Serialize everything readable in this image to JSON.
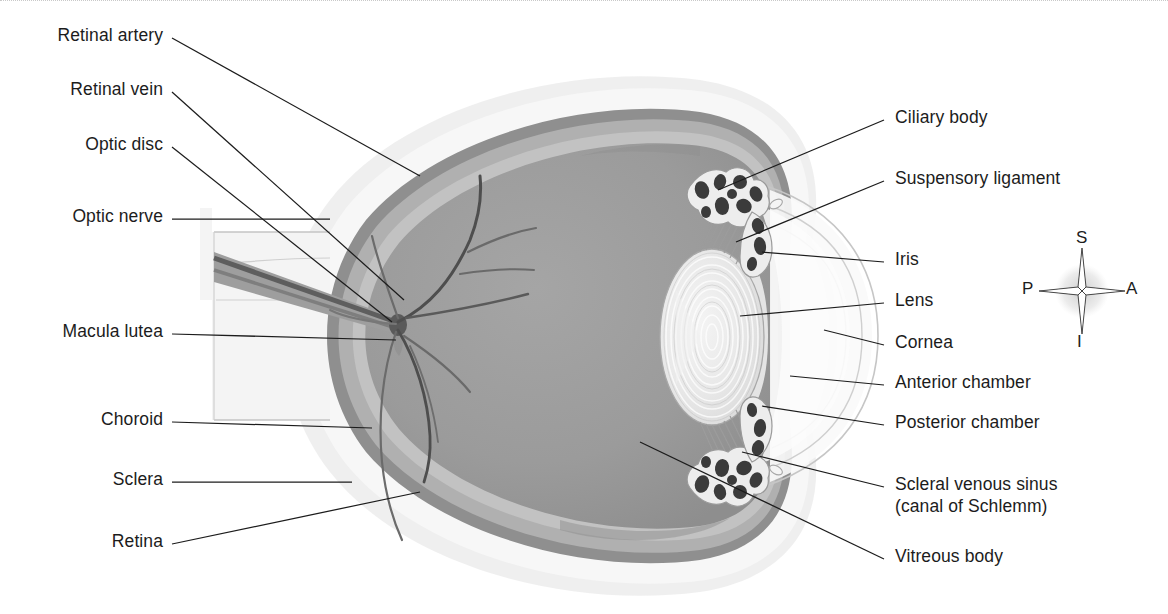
{
  "labels_left": [
    {
      "id": "retinal-artery",
      "text": "Retinal artery",
      "x": 163,
      "y": 34
    },
    {
      "id": "retinal-vein",
      "text": "Retinal vein",
      "x": 163,
      "y": 88
    },
    {
      "id": "optic-disc",
      "text": "Optic disc",
      "x": 163,
      "y": 143
    },
    {
      "id": "optic-nerve",
      "text": "Optic nerve",
      "x": 163,
      "y": 215
    },
    {
      "id": "macula-lutea",
      "text": "Macula lutea",
      "x": 163,
      "y": 330
    },
    {
      "id": "choroid",
      "text": "Choroid",
      "x": 163,
      "y": 418
    },
    {
      "id": "sclera",
      "text": "Sclera",
      "x": 163,
      "y": 478
    },
    {
      "id": "retina",
      "text": "Retina",
      "x": 163,
      "y": 540
    }
  ],
  "labels_right": [
    {
      "id": "ciliary-body",
      "text": "Ciliary body",
      "x": 895,
      "y": 116
    },
    {
      "id": "suspensory-ligament",
      "text": "Suspensory ligament",
      "x": 895,
      "y": 177
    },
    {
      "id": "iris",
      "text": "Iris",
      "x": 895,
      "y": 258
    },
    {
      "id": "lens",
      "text": "Lens",
      "x": 895,
      "y": 299
    },
    {
      "id": "cornea",
      "text": "Cornea",
      "x": 895,
      "y": 341
    },
    {
      "id": "anterior-chamber",
      "text": "Anterior chamber",
      "x": 895,
      "y": 381
    },
    {
      "id": "posterior-chamber",
      "text": "Posterior chamber",
      "x": 895,
      "y": 421
    },
    {
      "id": "scleral-venous-sinus",
      "text": "Scleral venous sinus",
      "x": 895,
      "y": 483
    },
    {
      "id": "canal-of-schlemm",
      "text": "(canal of Schlemm)",
      "x": 895,
      "y": 505
    },
    {
      "id": "vitreous-body",
      "text": "Vitreous body",
      "x": 895,
      "y": 555
    }
  ],
  "compass": {
    "superior": "S",
    "inferior": "I",
    "anterior": "A",
    "posterior": "P",
    "center_x": 1082,
    "center_y": 291
  },
  "colors": {
    "vitreous": "#9a9a9a",
    "retina": "#b8b8b8",
    "choroid": "#8d8d8d",
    "sclera": "#f2f2f2",
    "sclera_outer": "#e8e8e8",
    "lens": "#e6e6e6",
    "iris": "#3a3a3a",
    "ciliary": "#4a4a4a",
    "vessel": "#6e6e6e",
    "leader": "#1c1c1c",
    "text": "#1c1c1c",
    "cornea_line": "#bdbdbd"
  }
}
